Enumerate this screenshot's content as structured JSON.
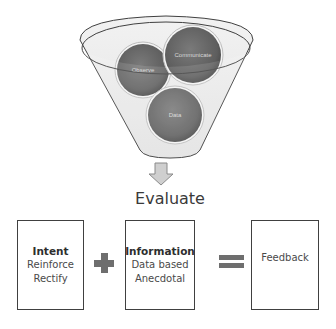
{
  "funnel": {
    "inputs": [
      {
        "label": "Observe",
        "cx": 143,
        "cy": 70,
        "r": 27
      },
      {
        "label": "Communicate",
        "cx": 193,
        "cy": 55,
        "r": 29
      },
      {
        "label": "Data",
        "cx": 175,
        "cy": 115,
        "r": 28
      }
    ],
    "output_label": "Evaluate"
  },
  "equation": {
    "boxes": [
      {
        "title": "Intent",
        "lines": [
          "Reinforce",
          "Rectify"
        ]
      },
      {
        "title": "Information",
        "lines": [
          "Data based",
          "Anecdotal"
        ]
      },
      {
        "title": "",
        "lines": [
          "Feedback"
        ]
      }
    ],
    "operators": [
      "plus",
      "equals"
    ]
  },
  "colors": {
    "circle_fill": "#6a6a6a",
    "funnel_fill": "#ebebeb",
    "outline": "#404040",
    "operator": "#6e6e6e",
    "text": "#3a3a3a"
  }
}
